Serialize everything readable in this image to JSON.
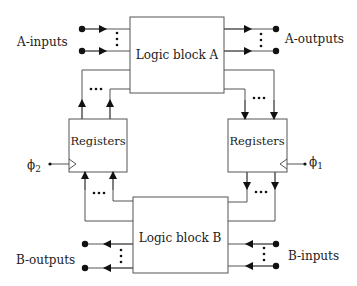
{
  "blocks": {
    "logic_a": "Logic block A",
    "logic_b": "Logic block B",
    "reg_left": "Registers",
    "reg_right": "Registers"
  },
  "labels": {
    "a_inputs": "A-inputs",
    "a_outputs": "A-outputs",
    "b_inputs": "B-inputs",
    "b_outputs": "B-outputs",
    "phi2": "ϕ",
    "phi2_sub": "2",
    "phi1": "ϕ",
    "phi1_sub": "1",
    "ellipsis": "•••",
    "vdots": "⋮"
  },
  "colors": {
    "line": "#555555",
    "text": "#222222",
    "dot": "#111111"
  }
}
